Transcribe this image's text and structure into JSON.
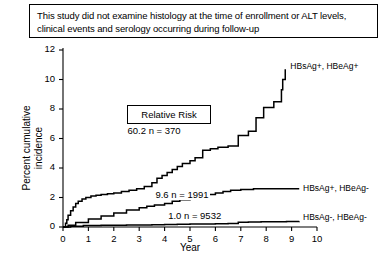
{
  "caption": {
    "text": "This study did not examine histology at the time of enrollment or ALT levels, clinical events and serology occurring during follow-up"
  },
  "chart_data": {
    "type": "line",
    "title": "",
    "subtitle": "",
    "xlabel": "Year",
    "ylabel": "Percent cumulative incidence",
    "xlim": [
      0,
      10
    ],
    "ylim": [
      0,
      12
    ],
    "xticks": [
      0,
      1,
      2,
      3,
      4,
      5,
      6,
      7,
      8,
      9,
      10
    ],
    "xtick_labels": [
      "0",
      "1",
      "2",
      "3",
      "4",
      "5",
      "6",
      "7",
      "8",
      "9",
      "10"
    ],
    "yticks": [
      0,
      2,
      4,
      6,
      8,
      10,
      12
    ],
    "ytick_labels": [
      "0",
      "2",
      "4",
      "6",
      "8",
      "10",
      "12"
    ],
    "grid": false,
    "legend_position": "right-inline",
    "annotation_box": {
      "label": "Relative Risk"
    },
    "series": [
      {
        "name": "HBsAg+, HBeAg+",
        "label": "HBsAg+, HBeAg+",
        "relative_risk": "60.2",
        "n": "370",
        "annotation": "60.2  n = 370",
        "style": "step",
        "x": [
          0.0,
          0.1,
          0.15,
          0.2,
          0.3,
          0.4,
          0.5,
          0.6,
          0.75,
          0.9,
          1.1,
          1.3,
          1.5,
          1.75,
          2.0,
          2.3,
          2.6,
          2.9,
          3.2,
          3.5,
          3.7,
          3.9,
          4.1,
          4.3,
          4.5,
          4.7,
          5.0,
          5.2,
          5.5,
          5.8,
          6.1,
          6.5,
          6.9,
          7.3,
          7.6,
          7.9,
          8.3,
          8.6,
          8.65,
          8.75
        ],
        "y": [
          0.0,
          0.25,
          0.5,
          0.8,
          1.1,
          1.35,
          1.6,
          1.75,
          1.9,
          2.0,
          2.1,
          2.15,
          2.2,
          2.25,
          2.3,
          2.4,
          2.5,
          2.6,
          2.75,
          3.0,
          3.3,
          3.5,
          3.7,
          3.9,
          4.1,
          4.3,
          4.5,
          4.7,
          5.2,
          5.3,
          5.4,
          5.5,
          6.2,
          6.5,
          7.4,
          8.1,
          8.5,
          9.3,
          10.0,
          10.7
        ]
      },
      {
        "name": "HBsAg+, HBeAg-",
        "label": "HBsAg+, HBeAg-",
        "relative_risk": "9.6",
        "n": "1991",
        "annotation": "9.6  n = 1991",
        "style": "step",
        "x": [
          0.0,
          0.2,
          0.5,
          1.0,
          1.5,
          2.0,
          2.5,
          3.0,
          3.3,
          3.6,
          4.0,
          4.3,
          4.6,
          5.0,
          5.3,
          5.6,
          6.0,
          6.3,
          6.6,
          7.0,
          7.5,
          8.0,
          8.5,
          9.0,
          9.3
        ],
        "y": [
          0.0,
          0.12,
          0.3,
          0.55,
          0.75,
          0.95,
          1.15,
          1.3,
          1.4,
          1.5,
          1.6,
          1.75,
          1.85,
          2.0,
          2.1,
          2.2,
          2.3,
          2.4,
          2.5,
          2.55,
          2.6,
          2.6,
          2.6,
          2.6,
          2.6
        ]
      },
      {
        "name": "HBsAg-, HBeAg-",
        "label": "HBsAg-, HBeAg-",
        "relative_risk": "1.0",
        "n": "9532",
        "annotation": "1.0  n = 9532",
        "style": "step",
        "x": [
          0.0,
          0.3,
          0.8,
          1.5,
          2.5,
          3.5,
          4.0,
          4.5,
          5.0,
          5.5,
          6.0,
          6.5,
          6.9,
          7.3,
          7.8,
          8.3,
          8.8,
          9.3
        ],
        "y": [
          0.0,
          0.05,
          0.1,
          0.12,
          0.14,
          0.16,
          0.17,
          0.18,
          0.2,
          0.21,
          0.22,
          0.24,
          0.33,
          0.34,
          0.35,
          0.36,
          0.37,
          0.38
        ]
      }
    ]
  }
}
